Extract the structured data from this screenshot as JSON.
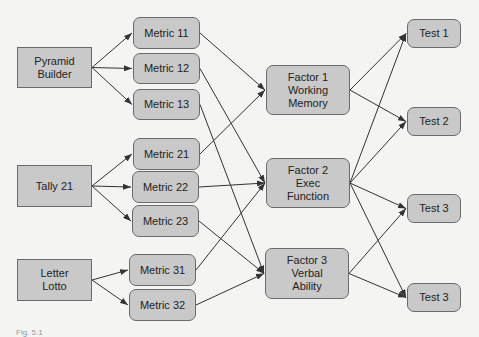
{
  "diagram": {
    "type": "flow",
    "colors": {
      "node_fill": "#c9c9c9",
      "node_border": "#6a6a6a",
      "edge": "#333333",
      "background": "#f4f4f2"
    },
    "nodes": [
      {
        "id": "pb",
        "label": "Pyramid\nBuilder",
        "shape": "rect",
        "x": 17,
        "y": 47,
        "w": 75,
        "h": 41
      },
      {
        "id": "t21",
        "label": "Tally 21",
        "shape": "rect",
        "x": 17,
        "y": 165,
        "w": 75,
        "h": 42
      },
      {
        "id": "ll",
        "label": "Letter\nLotto",
        "shape": "rect",
        "x": 17,
        "y": 259,
        "w": 75,
        "h": 42
      },
      {
        "id": "m11",
        "label": "Metric 11",
        "shape": "round",
        "x": 133,
        "y": 17,
        "w": 67,
        "h": 32
      },
      {
        "id": "m12",
        "label": "Metric 12",
        "shape": "round",
        "x": 133,
        "y": 53,
        "w": 67,
        "h": 31
      },
      {
        "id": "m13",
        "label": "Metric 13",
        "shape": "round",
        "x": 133,
        "y": 89,
        "w": 67,
        "h": 31
      },
      {
        "id": "m21",
        "label": "Metric 21",
        "shape": "round",
        "x": 133,
        "y": 138,
        "w": 67,
        "h": 32
      },
      {
        "id": "m22",
        "label": "Metric 22",
        "shape": "round",
        "x": 132,
        "y": 171,
        "w": 67,
        "h": 32
      },
      {
        "id": "m23",
        "label": "Metric 23",
        "shape": "round",
        "x": 132,
        "y": 205,
        "w": 67,
        "h": 32
      },
      {
        "id": "m31",
        "label": "Metric 31",
        "shape": "round",
        "x": 129,
        "y": 254,
        "w": 67,
        "h": 32
      },
      {
        "id": "m32",
        "label": "Metric 32",
        "shape": "round",
        "x": 129,
        "y": 289,
        "w": 67,
        "h": 32
      },
      {
        "id": "f1",
        "label": "Factor 1\nWorking\nMemory",
        "shape": "round",
        "x": 266,
        "y": 65,
        "w": 84,
        "h": 50
      },
      {
        "id": "f2",
        "label": "Factor 2\nExec\nFunction",
        "shape": "round",
        "x": 266,
        "y": 158,
        "w": 84,
        "h": 50
      },
      {
        "id": "f3",
        "label": "Factor 3\nVerbal\nAbility",
        "shape": "round",
        "x": 265,
        "y": 248,
        "w": 84,
        "h": 51
      },
      {
        "id": "t1",
        "label": "Test 1",
        "shape": "round",
        "x": 407,
        "y": 19,
        "w": 54,
        "h": 29
      },
      {
        "id": "t2",
        "label": "Test 2",
        "shape": "round",
        "x": 407,
        "y": 107,
        "w": 54,
        "h": 29
      },
      {
        "id": "t3a",
        "label": "Test 3",
        "shape": "round",
        "x": 407,
        "y": 194,
        "w": 54,
        "h": 29
      },
      {
        "id": "t3b",
        "label": "Test 3",
        "shape": "round",
        "x": 407,
        "y": 283,
        "w": 54,
        "h": 29
      }
    ],
    "edges": [
      [
        "pb",
        "m11"
      ],
      [
        "pb",
        "m12"
      ],
      [
        "pb",
        "m13"
      ],
      [
        "t21",
        "m21"
      ],
      [
        "t21",
        "m22"
      ],
      [
        "t21",
        "m23"
      ],
      [
        "ll",
        "m31"
      ],
      [
        "ll",
        "m32"
      ],
      [
        "m11",
        "f1"
      ],
      [
        "m21",
        "f1"
      ],
      [
        "m12",
        "f2"
      ],
      [
        "m22",
        "f2"
      ],
      [
        "m31",
        "f2"
      ],
      [
        "m13",
        "f3"
      ],
      [
        "m23",
        "f3"
      ],
      [
        "m32",
        "f3"
      ],
      [
        "f1",
        "t1"
      ],
      [
        "f1",
        "t2"
      ],
      [
        "f2",
        "t1"
      ],
      [
        "f2",
        "t2"
      ],
      [
        "f2",
        "t3a"
      ],
      [
        "f2",
        "t3b"
      ],
      [
        "f3",
        "t3a"
      ],
      [
        "f3",
        "t3b"
      ]
    ]
  },
  "caption": "Fig. 5.1"
}
